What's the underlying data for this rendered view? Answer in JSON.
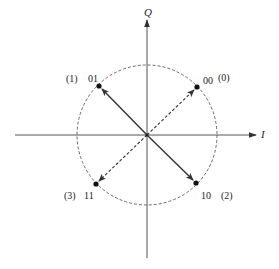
{
  "diagram": {
    "type": "QPSK constellation",
    "axes": {
      "horizontal_label": "I",
      "vertical_label": "Q"
    },
    "circle": {
      "style": "dashed"
    },
    "points": [
      {
        "bits": "00",
        "index": "(0)",
        "quadrant": "upper-right",
        "arrow": "dashed"
      },
      {
        "bits": "01",
        "index": "(1)",
        "quadrant": "upper-left",
        "arrow": "solid"
      },
      {
        "bits": "10",
        "index": "(2)",
        "quadrant": "lower-right",
        "arrow": "solid"
      },
      {
        "bits": "11",
        "index": "(3)",
        "quadrant": "lower-left",
        "arrow": "dashed"
      }
    ],
    "colors": {
      "line": "#333333",
      "background": "#ffffff"
    }
  }
}
